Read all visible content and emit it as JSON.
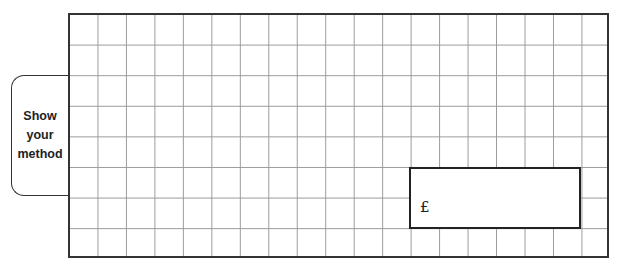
{
  "method_tab": {
    "lines": [
      "Show",
      "your",
      "method"
    ]
  },
  "working_grid": {
    "columns": 19,
    "rows": 8
  },
  "answer_box": {
    "currency_symbol": "£",
    "value": ""
  }
}
